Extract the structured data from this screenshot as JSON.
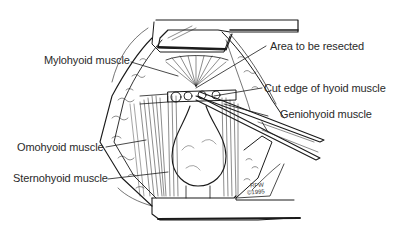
{
  "figure": {
    "labels": {
      "mylohyoid": "Mylohyoid muscle",
      "area_resected": "Area to be resected",
      "cut_edge": "Cut edge of hyoid muscle",
      "geniohyoid": "Geniohyoid muscle",
      "omohyoid": "Omohyoid muscle",
      "sternohyoid": "Sternohyoid muscle"
    },
    "signature": {
      "initials": "RFW",
      "year": "©1995"
    },
    "colors": {
      "ink": "#1a1a1a",
      "paper": "#ffffff",
      "label_text": "#2a2a2a"
    }
  }
}
